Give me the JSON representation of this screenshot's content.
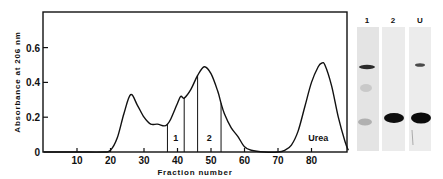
{
  "chart_data": {
    "type": "line",
    "title": "",
    "xlabel": "Fraction number",
    "ylabel": "Absorbance at 206 nm",
    "xlim": [
      0,
      92
    ],
    "ylim": [
      0,
      0.8
    ],
    "x_ticks": [
      10,
      20,
      30,
      40,
      50,
      60,
      70,
      80
    ],
    "x_tick_labels": [
      "10",
      "20",
      "30",
      "40",
      "50",
      "60",
      "70",
      "80"
    ],
    "y_ticks": [
      0,
      0.2,
      0.4,
      0.6
    ],
    "y_tick_labels": [
      "0",
      "0.2",
      "0.4",
      "0.6"
    ],
    "grid": false,
    "legend": null,
    "series": [
      {
        "name": "Absorbance",
        "x": [
          0,
          10,
          18,
          20,
          22,
          24,
          26,
          28,
          30,
          32,
          34,
          36,
          37,
          38,
          40,
          41,
          42,
          44,
          46,
          48,
          50,
          52,
          53,
          54,
          56,
          58,
          60,
          62,
          66,
          70,
          72,
          74,
          76,
          78,
          80,
          82,
          83,
          84,
          86,
          88,
          90,
          91
        ],
        "values": [
          0.0,
          0.0,
          0.0,
          0.01,
          0.08,
          0.22,
          0.33,
          0.27,
          0.2,
          0.16,
          0.16,
          0.15,
          0.16,
          0.19,
          0.28,
          0.32,
          0.31,
          0.36,
          0.44,
          0.49,
          0.45,
          0.35,
          0.28,
          0.22,
          0.14,
          0.09,
          0.03,
          0.01,
          0.0,
          0.0,
          0.01,
          0.04,
          0.12,
          0.26,
          0.4,
          0.49,
          0.51,
          0.5,
          0.38,
          0.2,
          0.06,
          0.01
        ]
      }
    ],
    "vertical_lines": [
      37,
      42,
      46,
      53
    ],
    "annotations": [
      {
        "text": "1",
        "x": 39.5,
        "y": 0.08
      },
      {
        "text": "2",
        "x": 49.5,
        "y": 0.08
      },
      {
        "text": "Urea",
        "x": 82,
        "y": 0.08
      }
    ],
    "gel_lanes": [
      {
        "label": "1"
      },
      {
        "label": "2"
      },
      {
        "label": "U"
      }
    ]
  }
}
